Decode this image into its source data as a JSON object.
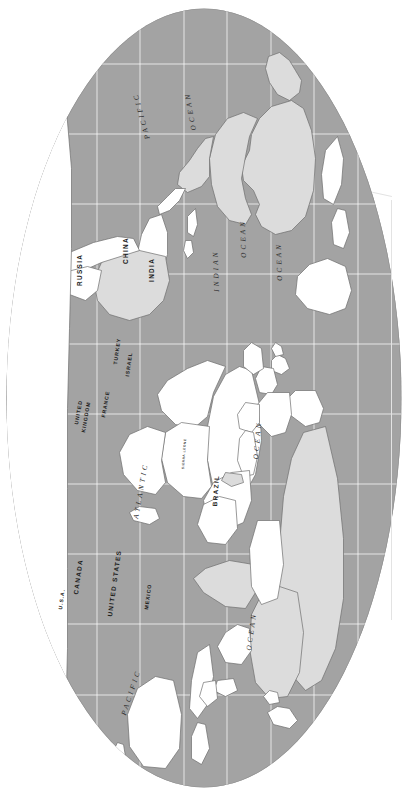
{
  "document": {
    "type": "world-map",
    "title": "World Map",
    "orientation": "rotated-90-clockwise",
    "projection": "oval (Robinson-like) whole-world projection",
    "background_color": "#ffffff",
    "ocean_color": "#a3a3a3",
    "land_fill_color": "#ffffff",
    "highlighted_land_color": "#dcdcdc",
    "graticule_color": "#ffffff",
    "coastline_color": "#707070",
    "label_color": "#1c1c1c"
  },
  "labels": {
    "countries": [
      {
        "id": "russia",
        "text": "RUSSIA"
      },
      {
        "id": "china",
        "text": "CHINA"
      },
      {
        "id": "india",
        "text": "INDIA"
      },
      {
        "id": "turkey",
        "text": "TURKEY"
      },
      {
        "id": "israel",
        "text": "ISRAEL"
      },
      {
        "id": "france",
        "text": "FRANCE"
      },
      {
        "id": "united-kingdom",
        "text": "UNITED"
      },
      {
        "id": "united-kingdom2",
        "text": "KINGDOM"
      },
      {
        "id": "canada",
        "text": "CANADA"
      },
      {
        "id": "united-states",
        "text": "UNITED STATES"
      },
      {
        "id": "mexico",
        "text": "MEXICO"
      },
      {
        "id": "usa-alaska",
        "text": "U.S.A."
      },
      {
        "id": "brazil",
        "text": "BRAZIL"
      },
      {
        "id": "sierra-leone",
        "text": "SIERRA LEONE"
      }
    ],
    "oceans": [
      {
        "id": "pacific-north",
        "text": "PACIFIC"
      },
      {
        "id": "ocean-north",
        "text": "OCEAN"
      },
      {
        "id": "ocean-east",
        "text": "OCEAN"
      },
      {
        "id": "indian",
        "text": "INDIAN"
      },
      {
        "id": "ocean-indian",
        "text": "OCEAN"
      },
      {
        "id": "atlantic",
        "text": "ATLANTIC"
      },
      {
        "id": "ocean-atlantic",
        "text": "OCEAN"
      },
      {
        "id": "pacific-south",
        "text": "PACIFIC"
      },
      {
        "id": "ocean-south",
        "text": "OCEAN"
      }
    ]
  }
}
